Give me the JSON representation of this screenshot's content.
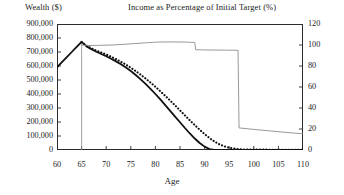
{
  "titles": {
    "left_axis": "Wealth ($)",
    "right_axis": "Income as Percentage of Initial Target (%)",
    "x_axis": "Age"
  },
  "chart_data": {
    "type": "line",
    "title": "",
    "xlabel": "Age",
    "ylabel": "Wealth ($)",
    "y2label": "Income as Percentage of Initial Target (%)",
    "xlim": [
      60,
      110
    ],
    "ylim": [
      0,
      900000
    ],
    "y2lim": [
      0,
      120
    ],
    "xticks": [
      60,
      65,
      70,
      75,
      80,
      85,
      90,
      95,
      100,
      105,
      110
    ],
    "xtick_labels": [
      "60",
      "65",
      "70",
      "75",
      "80",
      "85",
      "90",
      "95",
      "100",
      "105",
      "110"
    ],
    "yticks": [
      0,
      100000,
      200000,
      300000,
      400000,
      500000,
      600000,
      700000,
      800000,
      900000
    ],
    "ytick_labels": [
      "0",
      "100,000",
      "200,000",
      "300,000",
      "400,000",
      "500,000",
      "600,000",
      "700,000",
      "800,000",
      "900,000"
    ],
    "y2ticks": [
      0,
      20,
      40,
      60,
      80,
      100,
      120
    ],
    "y2tick_labels": [
      "0",
      "20",
      "40",
      "60",
      "80",
      "100",
      "120"
    ],
    "grid": false,
    "legend": "none",
    "series": [
      {
        "name": "Wealth (solid)",
        "axis": "left",
        "style": "solid",
        "color": "#111111",
        "width": 1.8,
        "x": [
          60,
          61,
          62,
          63,
          64,
          65,
          66,
          67,
          68,
          69,
          70,
          71,
          72,
          73,
          74,
          75,
          76,
          77,
          78,
          79,
          80,
          81,
          82,
          83,
          84,
          85,
          86,
          87,
          88,
          89,
          90,
          91,
          92,
          93,
          95,
          100,
          105,
          110
        ],
        "y": [
          590000,
          627000,
          663000,
          700000,
          736000,
          772000,
          740000,
          720000,
          702000,
          686000,
          670000,
          652000,
          633000,
          612000,
          589000,
          564000,
          536000,
          505000,
          472000,
          437000,
          400000,
          361000,
          321000,
          280000,
          239000,
          198000,
          157000,
          118000,
          82000,
          50000,
          24000,
          7000,
          0,
          0,
          0,
          0,
          0,
          0
        ]
      },
      {
        "name": "Wealth alternative (dotted)",
        "axis": "left",
        "style": "dotted",
        "color": "#111111",
        "width": 2.1,
        "x": [
          65,
          66,
          67,
          68,
          69,
          70,
          71,
          72,
          73,
          74,
          75,
          76,
          77,
          78,
          79,
          80,
          81,
          82,
          83,
          84,
          85,
          86,
          87,
          88,
          89,
          90,
          91,
          92,
          93,
          94,
          95,
          96,
          97,
          98,
          99,
          100,
          102,
          104,
          106,
          108,
          110
        ],
        "y": [
          772000,
          745000,
          726000,
          710000,
          696000,
          682000,
          666000,
          649000,
          630000,
          610000,
          588000,
          564000,
          538000,
          511000,
          482000,
          452000,
          420000,
          387000,
          353000,
          318000,
          283000,
          247000,
          212000,
          178000,
          145000,
          114000,
          86000,
          61000,
          41000,
          26000,
          16000,
          10000,
          6000,
          4000,
          3000,
          3000,
          2500,
          2000,
          2000,
          1500,
          1500
        ]
      },
      {
        "name": "Income as percentage of initial target",
        "axis": "right",
        "style": "thin-solid",
        "color": "#8c8c8c",
        "width": 0.9,
        "x": [
          65,
          66,
          68,
          70,
          72,
          74,
          76,
          78,
          80,
          82,
          84,
          86,
          87,
          88,
          88.2,
          90,
          92,
          94,
          96,
          96.8,
          97,
          98,
          100,
          103,
          106,
          110
        ],
        "y": [
          100,
          99.5,
          99.6,
          99.8,
          100.2,
          100.8,
          101.4,
          102.1,
          102.7,
          102.9,
          102.9,
          102.8,
          102.6,
          102.4,
          95.5,
          95.3,
          95.2,
          95.1,
          95.0,
          95.0,
          21.0,
          20.6,
          19.6,
          18.3,
          17.0,
          15.4
        ]
      }
    ],
    "annotations": [
      {
        "name": "retirement-age-marker",
        "type": "vertical-line",
        "x": 65,
        "color": "#8c8c8c",
        "from_y": 772000,
        "to_y": 0
      }
    ]
  }
}
